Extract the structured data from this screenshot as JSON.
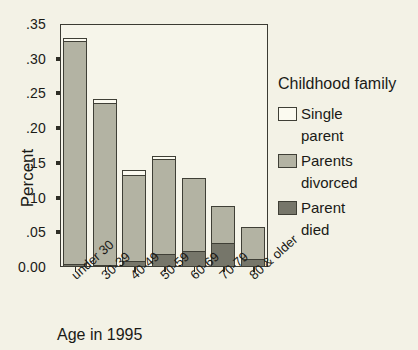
{
  "chart_data": {
    "type": "bar",
    "stacked": true,
    "title": "",
    "xlabel": "Age in 1995",
    "ylabel": "Percent",
    "ylim": [
      0.0,
      0.35
    ],
    "ytick_labels": [
      "0.00",
      ".05",
      ".10",
      ".15",
      ".20",
      ".25",
      ".30",
      ".35"
    ],
    "ytick_values": [
      0.0,
      0.05,
      0.1,
      0.15,
      0.2,
      0.25,
      0.3,
      0.35
    ],
    "grid": false,
    "legend_position": "right",
    "legend_title": "Childhood family",
    "categories": [
      "under 30",
      "30-39",
      "40-49",
      "50-59",
      "60-69",
      "70-79",
      "80 & older"
    ],
    "series": [
      {
        "name": "Parent died",
        "color": "#76766a",
        "values": [
          0.004,
          0.003,
          0.008,
          0.019,
          0.023,
          0.034,
          0.012
        ]
      },
      {
        "name": "Parents divorced",
        "color": "#b3b3a3",
        "values": [
          0.321,
          0.233,
          0.125,
          0.137,
          0.105,
          0.054,
          0.045
        ]
      },
      {
        "name": "Single parent",
        "color": "#fbfaf0",
        "values": [
          0.005,
          0.006,
          0.007,
          0.004,
          0.0,
          0.0,
          0.0
        ]
      }
    ],
    "totals": [
      0.33,
      0.242,
      0.14,
      0.16,
      0.128,
      0.088,
      0.057
    ]
  },
  "legend": {
    "title": "Childhood family",
    "entries": [
      {
        "label_line1": "Single",
        "label_line2": "parent",
        "color": "#fbfaf0"
      },
      {
        "label_line1": "Parents",
        "label_line2": "divorced",
        "color": "#b3b3a3"
      },
      {
        "label_line1": "Parent",
        "label_line2": "died",
        "color": "#76766a"
      }
    ]
  },
  "axes": {
    "y_title": "Percent",
    "x_title": "Age in 1995"
  }
}
